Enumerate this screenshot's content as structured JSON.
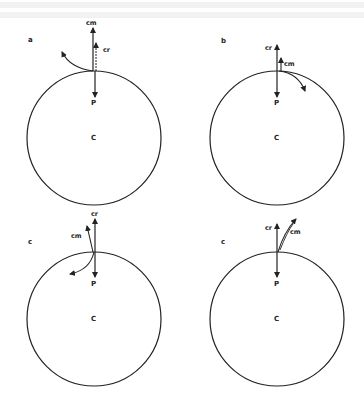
{
  "figure": {
    "type": "physics-diagram",
    "stroke_color": "#222222",
    "panels": [
      {
        "id": "a",
        "label": "a",
        "center_label": "C",
        "point_label": "P",
        "vector_labels": {
          "cm": "cm",
          "cr": "cr"
        },
        "curl_direction": "counterclockwise-left"
      },
      {
        "id": "b",
        "label": "b",
        "center_label": "C",
        "point_label": "P",
        "vector_labels": {
          "cm": "cm",
          "cr": "cr"
        },
        "curl_direction": "clockwise-right"
      },
      {
        "id": "c1",
        "label": "c",
        "center_label": "C",
        "point_label": "P",
        "vector_labels": {
          "cm": "cm",
          "cr": "cr"
        },
        "curl_direction": "down-left"
      },
      {
        "id": "c2",
        "label": "c",
        "center_label": "C",
        "point_label": "P",
        "vector_labels": {
          "cm": "cm",
          "cr": "cr"
        },
        "curl_direction": "up-right"
      }
    ]
  }
}
